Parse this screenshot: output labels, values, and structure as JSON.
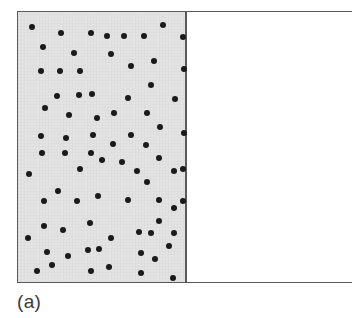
{
  "figure": {
    "panel_label": "(a)",
    "colors": {
      "gas_fill": "#e3e3e3",
      "vacuum_fill": "#ffffff",
      "border": "#5a5a5a",
      "particle": "#1a1a1a",
      "label_text": "#3a3a3a"
    },
    "container": {
      "x": 17,
      "y": 11,
      "width": 335,
      "height": 272,
      "border_width": 1.5
    },
    "gas_region": {
      "x": 0,
      "y": 0,
      "width": 168,
      "height": 272
    },
    "vacuum_region": {
      "x": 168,
      "y": 0,
      "width": 167,
      "height": 272
    },
    "partition": {
      "x": 167,
      "width": 1.5
    },
    "particle_diameter": 6.5
  },
  "chart_data": {
    "type": "scatter",
    "title": "",
    "subtitle": "",
    "xlabel": "",
    "ylabel": "",
    "annotations": [
      "(a)"
    ],
    "grid": false,
    "legend": null,
    "xlim": [
      0,
      335
    ],
    "ylim": [
      0,
      272
    ],
    "regions": [
      {
        "name": "gas-filled-half",
        "x0": 0,
        "x1": 168,
        "y0": 0,
        "y1": 272,
        "fill": "#e3e3e3"
      },
      {
        "name": "evacuated-half",
        "x0": 168,
        "x1": 335,
        "y0": 0,
        "y1": 272,
        "fill": "#ffffff"
      }
    ],
    "series": [
      {
        "name": "gas-particles",
        "count": 79,
        "marker": "filled-circle",
        "marker_size": 6.5,
        "color": "#1a1a1a",
        "points": [
          [
            14,
            15
          ],
          [
            43,
            21
          ],
          [
            73,
            21
          ],
          [
            25,
            35
          ],
          [
            56,
            41
          ],
          [
            23,
            59
          ],
          [
            42,
            59
          ],
          [
            62,
            59
          ],
          [
            145,
            13
          ],
          [
            89,
            24
          ],
          [
            106,
            24
          ],
          [
            126,
            24
          ],
          [
            165,
            25
          ],
          [
            93,
            42
          ],
          [
            136,
            49
          ],
          [
            113,
            54
          ],
          [
            166,
            57
          ],
          [
            39,
            84
          ],
          [
            61,
            83
          ],
          [
            74,
            82
          ],
          [
            27,
            96
          ],
          [
            51,
            103
          ],
          [
            79,
            106
          ],
          [
            23,
            124
          ],
          [
            48,
            126
          ],
          [
            75,
            123
          ],
          [
            133,
            73
          ],
          [
            110,
            86
          ],
          [
            157,
            87
          ],
          [
            96,
            101
          ],
          [
            129,
            101
          ],
          [
            142,
            115
          ],
          [
            113,
            123
          ],
          [
            95,
            132
          ],
          [
            128,
            133
          ],
          [
            166,
            121
          ],
          [
            24,
            141
          ],
          [
            47,
            141
          ],
          [
            73,
            141
          ],
          [
            62,
            157
          ],
          [
            11,
            162
          ],
          [
            40,
            179
          ],
          [
            26,
            189
          ],
          [
            59,
            189
          ],
          [
            80,
            184
          ],
          [
            84,
            148
          ],
          [
            104,
            150
          ],
          [
            141,
            146
          ],
          [
            119,
            159
          ],
          [
            156,
            159
          ],
          [
            165,
            157
          ],
          [
            129,
            170
          ],
          [
            141,
            188
          ],
          [
            110,
            188
          ],
          [
            156,
            196
          ],
          [
            165,
            189
          ],
          [
            26,
            214
          ],
          [
            45,
            218
          ],
          [
            72,
            211
          ],
          [
            10,
            226
          ],
          [
            29,
            240
          ],
          [
            50,
            244
          ],
          [
            70,
            238
          ],
          [
            81,
            237
          ],
          [
            19,
            259
          ],
          [
            34,
            253
          ],
          [
            73,
            259
          ],
          [
            141,
            209
          ],
          [
            121,
            220
          ],
          [
            133,
            221
          ],
          [
            156,
            221
          ],
          [
            93,
            226
          ],
          [
            151,
            234
          ],
          [
            123,
            241
          ],
          [
            137,
            247
          ],
          [
            91,
            255
          ],
          [
            123,
            261
          ],
          [
            155,
            266
          ]
        ]
      }
    ]
  }
}
